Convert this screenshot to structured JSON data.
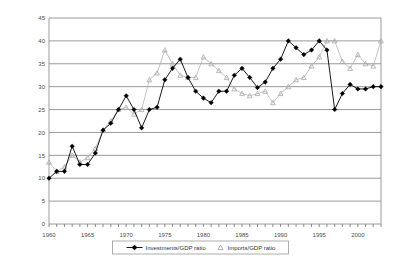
{
  "chart_data": {
    "type": "line",
    "title": "",
    "subtitle": "",
    "xlabel": "",
    "ylabel": "",
    "xlim": [
      1960,
      2003
    ],
    "ylim": [
      0,
      45
    ],
    "ytick_step": 5,
    "yticks": [
      "0",
      "5",
      "10",
      "15",
      "20",
      "25",
      "30",
      "35",
      "40",
      "45"
    ],
    "xticks": [
      "1960",
      "1965",
      "1970",
      "1975",
      "1980",
      "1985",
      "1990",
      "1995",
      "2000"
    ],
    "xtick_step": 5,
    "grid": "horizontal",
    "legend_position": "bottom",
    "x": [
      1960,
      1961,
      1962,
      1963,
      1964,
      1965,
      1966,
      1967,
      1968,
      1969,
      1970,
      1971,
      1972,
      1973,
      1974,
      1975,
      1976,
      1977,
      1978,
      1979,
      1980,
      1981,
      1982,
      1983,
      1984,
      1985,
      1986,
      1987,
      1988,
      1989,
      1990,
      1991,
      1992,
      1993,
      1994,
      1995,
      1996,
      1997,
      1998,
      1999,
      2000,
      2001,
      2002,
      2003
    ],
    "series": [
      {
        "name": "Investments/GDP ratio",
        "marker": "diamond",
        "color": "#000000",
        "line": true,
        "values": [
          10.0,
          11.5,
          11.5,
          17.0,
          13.0,
          13.0,
          15.5,
          20.5,
          22.0,
          25.0,
          28.0,
          25.0,
          21.0,
          25.0,
          25.5,
          31.5,
          34.0,
          36.0,
          32.0,
          29.0,
          27.5,
          26.5,
          29.0,
          29.0,
          32.5,
          34.0,
          32.0,
          29.8,
          31.0,
          34.0,
          36.0,
          40.0,
          38.5,
          37.0,
          38.0,
          40.0,
          38.0,
          25.0,
          28.5,
          30.5,
          29.5,
          29.5,
          30.0,
          30.0
        ]
      },
      {
        "name": "Imports/GDP ratio",
        "marker": "triangle",
        "color": "#aaaaaa",
        "line": true,
        "values": [
          13.5,
          11.5,
          12.5,
          15.0,
          13.5,
          14.5,
          16.5,
          20.5,
          22.5,
          25.0,
          25.5,
          24.0,
          25.0,
          31.5,
          33.0,
          38.0,
          35.0,
          32.5,
          32.0,
          32.0,
          36.5,
          35.0,
          33.5,
          32.0,
          29.5,
          28.5,
          28.0,
          28.5,
          29.0,
          26.5,
          28.5,
          30.0,
          31.5,
          32.0,
          34.5,
          36.5,
          40.0,
          40.0,
          35.5,
          34.0,
          37.0,
          35.0,
          34.5,
          40.0
        ]
      }
    ]
  },
  "legend": {
    "items": [
      {
        "label": "Investments/GDP ratio",
        "marker": "diamond"
      },
      {
        "label": "Imports/GDP ratio",
        "marker": "triangle"
      }
    ]
  }
}
